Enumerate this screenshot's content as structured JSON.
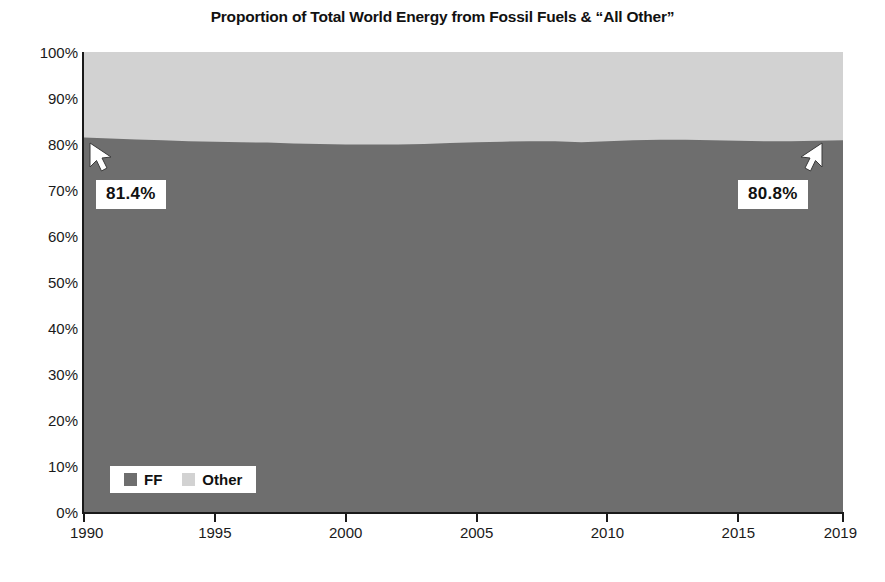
{
  "chart_data": {
    "type": "area",
    "title": "Proportion of Total World Energy from Fossil Fuels & “All Other”",
    "xlabel": "",
    "ylabel": "",
    "stacked": true,
    "grid": false,
    "legend_position": "bottom-left",
    "xlim": [
      1990,
      2019
    ],
    "ylim": [
      0,
      100
    ],
    "x_ticks": [
      1990,
      1995,
      2000,
      2005,
      2010,
      2015,
      2019
    ],
    "x_tick_labels": [
      "1990",
      "1995",
      "2000",
      "2005",
      "2010",
      "2015",
      "2019"
    ],
    "y_ticks": [
      0,
      10,
      20,
      30,
      40,
      50,
      60,
      70,
      80,
      90,
      100
    ],
    "y_tick_labels": [
      "0%",
      "10%",
      "20%",
      "30%",
      "40%",
      "50%",
      "60%",
      "70%",
      "80%",
      "90%",
      "100%"
    ],
    "x": [
      1990,
      1991,
      1992,
      1993,
      1994,
      1995,
      1996,
      1997,
      1998,
      1999,
      2000,
      2001,
      2002,
      2003,
      2004,
      2005,
      2006,
      2007,
      2008,
      2009,
      2010,
      2011,
      2012,
      2013,
      2014,
      2015,
      2016,
      2017,
      2018,
      2019
    ],
    "series": [
      {
        "name": "FF",
        "label": "FF",
        "color": "#6e6e6e",
        "values": [
          81.4,
          81.2,
          81.0,
          80.8,
          80.6,
          80.5,
          80.4,
          80.3,
          80.1,
          80.0,
          79.9,
          79.9,
          79.9,
          80.0,
          80.2,
          80.4,
          80.5,
          80.6,
          80.6,
          80.4,
          80.6,
          80.8,
          80.9,
          80.9,
          80.8,
          80.7,
          80.6,
          80.6,
          80.7,
          80.8
        ]
      },
      {
        "name": "Other",
        "label": "Other",
        "color": "#d2d2d2",
        "values": [
          18.6,
          18.8,
          19.0,
          19.2,
          19.4,
          19.5,
          19.6,
          19.7,
          19.9,
          20.0,
          20.1,
          20.1,
          20.1,
          20.0,
          19.8,
          19.6,
          19.5,
          19.4,
          19.4,
          19.6,
          19.4,
          19.2,
          19.1,
          19.1,
          19.2,
          19.3,
          19.4,
          19.4,
          19.3,
          19.2
        ]
      }
    ],
    "annotations": [
      {
        "text": "81.4%",
        "x": 1990,
        "y": 81.4,
        "arrow": "up-left"
      },
      {
        "text": "80.8%",
        "x": 2019,
        "y": 80.8,
        "arrow": "up-right"
      }
    ]
  },
  "colors": {
    "fossil_fuels": "#6e6e6e",
    "other": "#d2d2d2",
    "axis": "#1a1a1a",
    "text": "#111111",
    "callout_background": "#ffffff"
  },
  "legend": {
    "items": [
      {
        "label": "FF",
        "color": "#6e6e6e"
      },
      {
        "label": "Other",
        "color": "#d2d2d2"
      }
    ]
  },
  "annotations": {
    "left_value": "81.4%",
    "right_value": "80.8%"
  }
}
